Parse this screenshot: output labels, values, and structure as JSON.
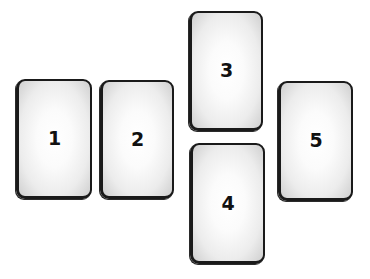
{
  "diagram": {
    "type": "card-spread-layout",
    "cards": [
      {
        "id": 1,
        "label": "1",
        "x": 16,
        "y": 79,
        "w": 76,
        "h": 120
      },
      {
        "id": 2,
        "label": "2",
        "x": 100,
        "y": 80,
        "w": 74,
        "h": 119
      },
      {
        "id": 3,
        "label": "3",
        "x": 189,
        "y": 11,
        "w": 74,
        "h": 120
      },
      {
        "id": 4,
        "label": "4",
        "x": 190,
        "y": 143,
        "w": 75,
        "h": 121
      },
      {
        "id": 5,
        "label": "5",
        "x": 278,
        "y": 81,
        "w": 75,
        "h": 120
      }
    ]
  }
}
